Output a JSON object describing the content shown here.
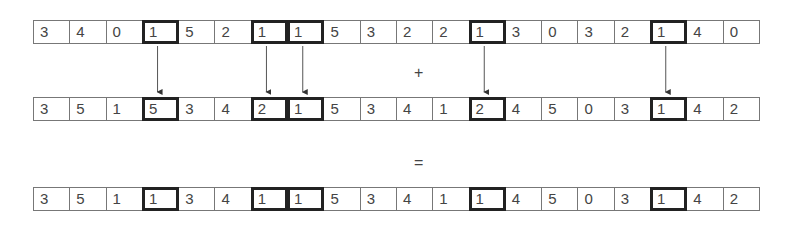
{
  "rows": [
    {
      "name": "input-a",
      "values": [
        3,
        4,
        0,
        1,
        5,
        2,
        1,
        1,
        5,
        3,
        2,
        2,
        1,
        3,
        0,
        3,
        2,
        1,
        4,
        0
      ]
    },
    {
      "name": "input-b",
      "values": [
        3,
        5,
        1,
        5,
        3,
        4,
        2,
        1,
        5,
        3,
        4,
        1,
        2,
        4,
        5,
        0,
        3,
        1,
        4,
        2
      ]
    },
    {
      "name": "result",
      "values": [
        3,
        5,
        1,
        1,
        3,
        4,
        1,
        1,
        5,
        3,
        4,
        1,
        1,
        4,
        5,
        0,
        3,
        1,
        4,
        2
      ]
    }
  ],
  "highlighted_indices": [
    3,
    6,
    7,
    12,
    17
  ],
  "operators": {
    "plus": "+",
    "equals": "="
  }
}
